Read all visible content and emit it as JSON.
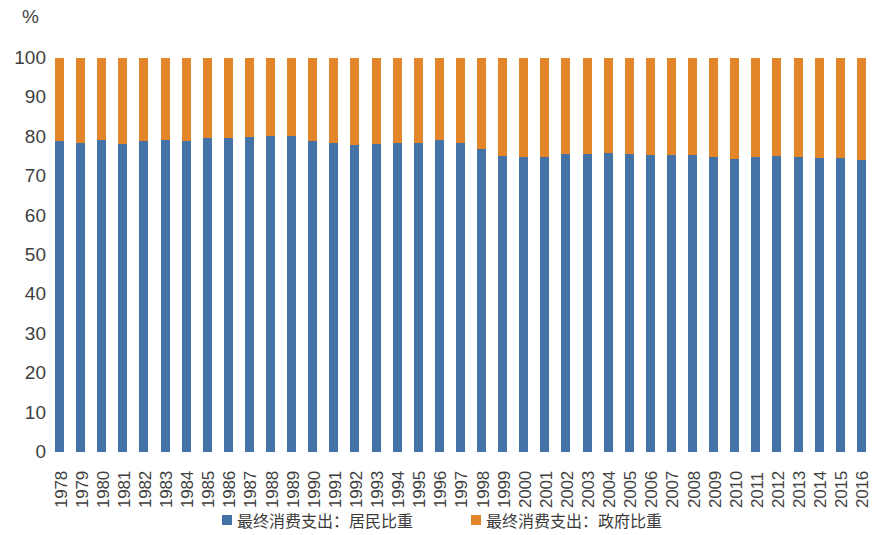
{
  "unit_label": "%",
  "legend": {
    "items": [
      {
        "label": "最终消费支出：居民比重",
        "color": "#4573A7",
        "key": "household"
      },
      {
        "label": "最终消费支出：政府比重",
        "color": "#E3862A",
        "key": "government"
      }
    ]
  },
  "axis": {
    "y_ticks": [
      "0",
      "10",
      "20",
      "30",
      "40",
      "50",
      "60",
      "70",
      "80",
      "90",
      "100"
    ]
  },
  "chart_data": {
    "type": "bar",
    "stacked": true,
    "stack_total": 100,
    "title": "",
    "subtitle": "",
    "xlabel": "",
    "ylabel": "%",
    "ylim": [
      0,
      100
    ],
    "ytick_step": 10,
    "grid": false,
    "legend_position": "bottom",
    "orientation": "vertical",
    "categories": [
      "1978",
      "1979",
      "1980",
      "1981",
      "1982",
      "1983",
      "1984",
      "1985",
      "1986",
      "1987",
      "1988",
      "1989",
      "1990",
      "1991",
      "1992",
      "1993",
      "1994",
      "1995",
      "1996",
      "1997",
      "1998",
      "1999",
      "2000",
      "2001",
      "2002",
      "2003",
      "2004",
      "2005",
      "2006",
      "2007",
      "2008",
      "2009",
      "2010",
      "2011",
      "2012",
      "2013",
      "2014",
      "2015",
      "2016"
    ],
    "series": [
      {
        "name": "最终消费支出：居民比重",
        "color": "#4573A7",
        "values": [
          78.9,
          78.5,
          79.2,
          78.3,
          79.0,
          79.3,
          79.0,
          79.6,
          79.8,
          79.9,
          80.3,
          80.2,
          79.0,
          78.4,
          78.0,
          78.2,
          78.4,
          78.4,
          79.2,
          78.4,
          77.0,
          75.1,
          75.0,
          74.9,
          75.7,
          75.6,
          75.9,
          75.7,
          75.3,
          75.3,
          75.3,
          74.9,
          74.3,
          74.9,
          75.1,
          74.8,
          74.5,
          74.5,
          74.1
        ]
      },
      {
        "name": "最终消费支出：政府比重",
        "color": "#E3862A",
        "values": [
          21.1,
          21.5,
          20.8,
          21.7,
          21.0,
          20.7,
          21.0,
          20.4,
          20.2,
          20.1,
          19.7,
          19.8,
          21.0,
          21.6,
          22.0,
          21.8,
          21.6,
          21.6,
          20.8,
          21.6,
          23.0,
          24.9,
          25.0,
          25.1,
          24.3,
          24.4,
          24.1,
          24.3,
          24.7,
          24.7,
          24.7,
          25.1,
          25.7,
          25.1,
          24.9,
          25.2,
          25.5,
          25.5,
          25.9
        ]
      }
    ]
  }
}
